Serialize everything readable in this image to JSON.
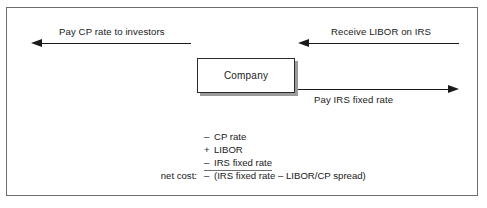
{
  "diagram": {
    "center_node": {
      "label": "Company"
    },
    "flows": [
      {
        "id": "pay-cp-rate",
        "label": "Pay CP rate to investors",
        "direction": "left",
        "side": "left-top",
        "label_position": "above"
      },
      {
        "id": "receive-libor",
        "label": "Receive LIBOR on IRS",
        "direction": "left",
        "side": "right-top",
        "label_position": "above"
      },
      {
        "id": "pay-irs-fixed",
        "label": "Pay IRS fixed rate",
        "direction": "right",
        "side": "right-bottom",
        "label_position": "below"
      }
    ],
    "calculation": {
      "rows": [
        {
          "tag": "",
          "sign": "–",
          "term": "CP rate",
          "ruled": false
        },
        {
          "tag": "",
          "sign": "+",
          "term": "LIBOR",
          "ruled": false
        },
        {
          "tag": "",
          "sign": "–",
          "term": "IRS fixed rate",
          "ruled": true
        },
        {
          "tag": "net cost:",
          "sign": "–",
          "term": "(IRS fixed rate – LIBOR/CP spread)",
          "ruled": false
        }
      ]
    },
    "colors": {
      "frame": "#6d6d6d",
      "arrow": "#1a1a1a",
      "text": "#1a1a1a",
      "box_border": "#2b2b2b",
      "box_shadow": "#9b9b9b",
      "background": "#ffffff"
    }
  }
}
